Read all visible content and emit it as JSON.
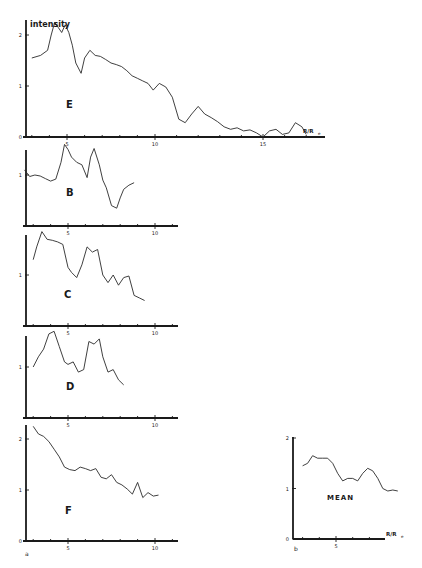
{
  "figure": {
    "y_axis_title": "intensity",
    "x_axis_title": "R/R",
    "x_axis_subscript": "e",
    "sublabel_a": "a",
    "sublabel_b": "b"
  },
  "chart_data": [
    {
      "type": "line",
      "panel": "E",
      "title": "E",
      "xlabel": "R/Re",
      "ylabel": "intensity",
      "xlim": [
        2.5,
        17.5
      ],
      "ylim": [
        0,
        2.3
      ],
      "xticks": [
        5,
        10,
        15
      ],
      "yticks": [
        0,
        1,
        2
      ],
      "x": [
        3.0,
        3.5,
        3.9,
        4.1,
        4.3,
        4.5,
        4.7,
        4.9,
        5.1,
        5.3,
        5.5,
        5.8,
        6.0,
        6.3,
        6.6,
        6.9,
        7.2,
        7.5,
        7.8,
        8.1,
        8.4,
        8.7,
        9.0,
        9.3,
        9.6,
        9.9,
        10.2,
        10.5,
        10.8,
        11.1,
        11.4,
        11.7,
        12.0,
        12.3,
        12.6,
        12.9,
        13.2,
        13.5,
        13.8,
        14.1,
        14.4,
        14.7,
        15.0,
        15.3,
        15.6,
        15.9,
        16.2,
        16.5,
        16.8,
        17.0
      ],
      "values": [
        1.55,
        1.6,
        1.7,
        2.0,
        2.25,
        2.15,
        2.05,
        2.2,
        2.05,
        1.8,
        1.45,
        1.25,
        1.55,
        1.7,
        1.6,
        1.58,
        1.52,
        1.45,
        1.42,
        1.38,
        1.3,
        1.2,
        1.15,
        1.1,
        1.05,
        0.92,
        1.05,
        0.98,
        0.78,
        0.35,
        0.28,
        0.45,
        0.6,
        0.45,
        0.38,
        0.3,
        0.2,
        0.15,
        0.18,
        0.12,
        0.14,
        0.08,
        0.0,
        0.12,
        0.15,
        0.05,
        0.08,
        0.28,
        0.2,
        0.05
      ]
    },
    {
      "type": "line",
      "panel": "B",
      "title": "B",
      "xlabel": "R/Re",
      "ylabel": "intensity",
      "xlim": [
        2.5,
        11
      ],
      "ylim": [
        0,
        1.8
      ],
      "xticks": [
        5,
        10
      ],
      "yticks": [
        1
      ],
      "x": [
        2.5,
        2.8,
        3.1,
        3.4,
        3.7,
        4.0,
        4.3,
        4.6,
        4.8,
        5.0,
        5.2,
        5.5,
        5.8,
        6.1,
        6.3,
        6.5,
        6.8,
        7.0,
        7.2,
        7.5,
        7.8,
        8.0,
        8.2,
        8.5,
        8.8
      ],
      "values": [
        1.1,
        0.97,
        1.0,
        0.98,
        0.93,
        0.88,
        0.92,
        1.25,
        1.6,
        1.5,
        1.35,
        1.25,
        1.2,
        0.95,
        1.35,
        1.52,
        1.2,
        0.9,
        0.75,
        0.4,
        0.35,
        0.55,
        0.72,
        0.8,
        0.85
      ]
    },
    {
      "type": "line",
      "panel": "C",
      "title": "C",
      "xlabel": "R/Re",
      "ylabel": "intensity",
      "xlim": [
        2.5,
        11
      ],
      "ylim": [
        0,
        1.8
      ],
      "xticks": [
        5,
        10
      ],
      "yticks": [
        1
      ],
      "x": [
        3.0,
        3.2,
        3.5,
        3.8,
        4.1,
        4.4,
        4.7,
        5.0,
        5.2,
        5.5,
        5.8,
        6.1,
        6.4,
        6.7,
        7.0,
        7.3,
        7.6,
        7.9,
        8.2,
        8.5,
        8.8,
        9.1,
        9.4
      ],
      "values": [
        1.3,
        1.55,
        1.85,
        1.7,
        1.68,
        1.65,
        1.6,
        1.15,
        1.05,
        0.95,
        1.2,
        1.55,
        1.45,
        1.5,
        1.0,
        0.85,
        1.0,
        0.8,
        0.95,
        0.98,
        0.6,
        0.55,
        0.5
      ]
    },
    {
      "type": "line",
      "panel": "D",
      "title": "D",
      "xlabel": "R/Re",
      "ylabel": "intensity",
      "xlim": [
        2.5,
        11
      ],
      "ylim": [
        0,
        1.8
      ],
      "xticks": [
        5,
        10
      ],
      "yticks": [
        1
      ],
      "x": [
        3.0,
        3.3,
        3.6,
        3.9,
        4.2,
        4.5,
        4.8,
        5.0,
        5.3,
        5.6,
        5.9,
        6.2,
        6.5,
        6.8,
        7.0,
        7.3,
        7.6,
        7.9,
        8.2
      ],
      "values": [
        1.0,
        1.2,
        1.35,
        1.65,
        1.7,
        1.4,
        1.1,
        1.05,
        1.1,
        0.9,
        0.95,
        1.5,
        1.45,
        1.55,
        1.2,
        0.9,
        0.95,
        0.75,
        0.65
      ]
    },
    {
      "type": "line",
      "panel": "F",
      "title": "F",
      "xlabel": "R/Re",
      "ylabel": "intensity",
      "xlim": [
        2.5,
        11
      ],
      "ylim": [
        0,
        2.3
      ],
      "xticks": [
        5,
        10
      ],
      "yticks": [
        0,
        1,
        2
      ],
      "x": [
        3.0,
        3.3,
        3.6,
        3.9,
        4.2,
        4.5,
        4.8,
        5.1,
        5.4,
        5.7,
        6.0,
        6.3,
        6.6,
        6.9,
        7.2,
        7.5,
        7.8,
        8.1,
        8.4,
        8.7,
        9.0,
        9.3,
        9.6,
        9.9,
        10.2
      ],
      "values": [
        2.25,
        2.1,
        2.05,
        1.95,
        1.8,
        1.65,
        1.45,
        1.4,
        1.38,
        1.45,
        1.42,
        1.38,
        1.42,
        1.25,
        1.22,
        1.3,
        1.15,
        1.1,
        1.02,
        0.92,
        1.15,
        0.85,
        0.95,
        0.88,
        0.9
      ]
    },
    {
      "type": "line",
      "panel": "MEAN",
      "title": "MEAN",
      "xlabel": "R/Re",
      "ylabel": "",
      "xlim": [
        2.5,
        10
      ],
      "ylim": [
        0,
        2
      ],
      "xticks": [
        5
      ],
      "yticks": [
        0,
        1,
        2
      ],
      "x": [
        3.0,
        3.3,
        3.6,
        3.9,
        4.2,
        4.5,
        4.8,
        5.1,
        5.4,
        5.7,
        6.0,
        6.3,
        6.6,
        6.9,
        7.2,
        7.5,
        7.8,
        8.1,
        8.4,
        8.7
      ],
      "values": [
        1.45,
        1.5,
        1.65,
        1.6,
        1.6,
        1.6,
        1.5,
        1.3,
        1.15,
        1.2,
        1.2,
        1.15,
        1.3,
        1.4,
        1.35,
        1.2,
        1.0,
        0.95,
        0.97,
        0.95
      ]
    }
  ]
}
